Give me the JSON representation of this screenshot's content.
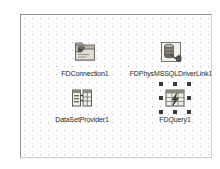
{
  "designer": {
    "name": "data-module-designer",
    "surface_color": "#fdfdfd",
    "grid_dot_color": "#b9b9b9",
    "grid_spacing_px": 8,
    "border_color": "#8d8d8d",
    "selection_handle_color": "#3a3a3a",
    "caption_color": "#2a2a2a"
  },
  "components": [
    {
      "id": "fdconnection1",
      "caption": "FDConnection1",
      "icon": "fdconnection-icon",
      "selected": false,
      "x": 64,
      "y": 24
    },
    {
      "id": "fdphysmssqldriverlink1",
      "caption": "FDPhysMSSQLDriverLink1",
      "icon": "fdphysmssqldriverlink-icon",
      "selected": false,
      "x": 150,
      "y": 24
    },
    {
      "id": "datasetprovider1",
      "caption": "DataSetProvider1",
      "icon": "datasetprovider-icon",
      "selected": false,
      "x": 61,
      "y": 70
    },
    {
      "id": "fdquery1",
      "caption": "FDQuery1",
      "icon": "fdquery-icon",
      "selected": true,
      "x": 154,
      "y": 70
    }
  ]
}
